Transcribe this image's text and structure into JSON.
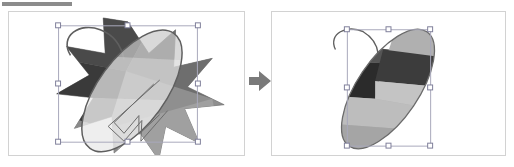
{
  "document": {
    "title_bar_label": "",
    "background_color": "#ffffff"
  },
  "toolbar": {
    "strip_label": "",
    "strip_color": "#8c8c8c"
  },
  "panels": [
    {
      "id": "before",
      "name": "before-panel",
      "caption": "",
      "border_color": "#d2d2d2",
      "objects": [
        {
          "name": "star-burst",
          "label": "Star",
          "fill_summary": "multi-tone grayscale bands"
        },
        {
          "name": "ellipse-path",
          "label": "Ellipse",
          "fill_summary": "outline with hook handle"
        }
      ],
      "selection": {
        "visible": true,
        "handle_count": 8,
        "handle_fill": "#ffffff",
        "handle_stroke": "#7f7f9a",
        "box_stroke": "#a8a8bb"
      }
    },
    {
      "id": "after",
      "name": "after-panel",
      "caption": "",
      "border_color": "#d2d2d2",
      "objects": [
        {
          "name": "clipped-ellipse",
          "label": "Intersection result",
          "fill_summary": "ellipse clipped to star bands"
        }
      ],
      "selection": {
        "visible": true,
        "handle_count": 8,
        "handle_fill": "#ffffff",
        "handle_stroke": "#7f7f9a",
        "box_stroke": "#a8a8bb"
      }
    }
  ],
  "arrow": {
    "name": "transform-arrow",
    "direction": "right",
    "color": "#7a7a7a",
    "label": ""
  },
  "palette": {
    "band_darkest": "#2a2a2a",
    "band_dark": "#4a4a4a",
    "band_mid_dark": "#6e6e6e",
    "band_mid": "#8f8f8f",
    "band_light": "#b0b0b0",
    "band_lighter": "#c9c9c9",
    "band_lightest": "#dedede",
    "outline": "#6b6b6b",
    "panel_border": "#d2d2d2",
    "handle_stroke": "#7f7f9a",
    "page_background": "#ffffff"
  }
}
